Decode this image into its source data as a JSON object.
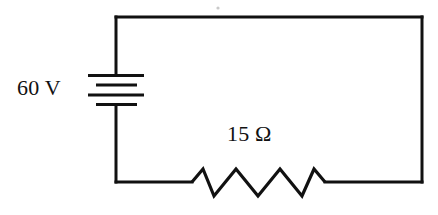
{
  "diagram": {
    "background_color": "#ffffff",
    "line_color": "#111111",
    "components": {
      "battery": {
        "label": "60 V",
        "type": "dc-voltage-source",
        "plate_count": 4,
        "plate_pattern": "long-short-long-short"
      },
      "resistor": {
        "label": "15 Ω",
        "type": "resistor",
        "zigzag_peaks": 3
      },
      "wires": {
        "type": "rectangular-loop",
        "left_x": 116,
        "right_x": 422,
        "top_y": 17,
        "bottom_y": 182
      }
    }
  }
}
